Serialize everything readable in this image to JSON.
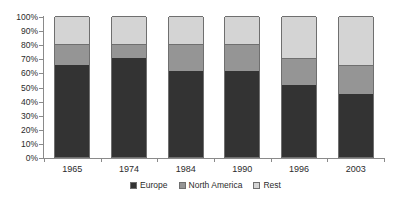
{
  "chart_data": {
    "type": "bar",
    "stacked": true,
    "title": "",
    "xlabel": "",
    "ylabel": "",
    "categories": [
      "1965",
      "1974",
      "1984",
      "1990",
      "1996",
      "2003"
    ],
    "series": [
      {
        "name": "Europe",
        "color": "#333333",
        "values": [
          65,
          70,
          61,
          61,
          51,
          45
        ]
      },
      {
        "name": "North America",
        "color": "#959595",
        "values": [
          15,
          10,
          19,
          19,
          19,
          20
        ]
      },
      {
        "name": "Rest",
        "color": "#d4d4d4",
        "values": [
          20,
          20,
          20,
          20,
          30,
          35
        ]
      }
    ],
    "ylim": [
      0,
      100
    ],
    "yticks": [
      "0%",
      "10%",
      "20%",
      "30%",
      "40%",
      "50%",
      "60%",
      "70%",
      "80%",
      "90%",
      "100%"
    ],
    "ytick_values": [
      0,
      10,
      20,
      30,
      40,
      50,
      60,
      70,
      80,
      90,
      100
    ],
    "grid": false,
    "legend_position": "bottom",
    "legend": [
      "Europe",
      "North America",
      "Rest"
    ],
    "axis_color": "#8a8a8a",
    "bar_border_color": "#6f6f6f",
    "background": "#ffffff"
  }
}
